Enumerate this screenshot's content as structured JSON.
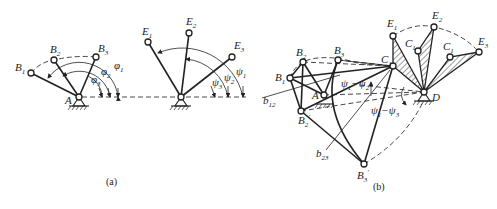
{
  "figure": {
    "panels": [
      {
        "id": "a",
        "caption": "(a)",
        "left_mechanism": {
          "pivot_label": "A",
          "points": [
            {
              "label": "B",
              "sub": "1"
            },
            {
              "label": "B",
              "sub": "2"
            },
            {
              "label": "B",
              "sub": "3"
            }
          ],
          "angles": [
            {
              "symbol": "φ",
              "sub": "1"
            },
            {
              "symbol": "φ",
              "sub": "2"
            },
            {
              "symbol": "φ",
              "sub": "3"
            }
          ]
        },
        "right_mechanism": {
          "points": [
            {
              "label": "E",
              "sub": "1"
            },
            {
              "label": "E",
              "sub": "2"
            },
            {
              "label": "E",
              "sub": "3"
            }
          ],
          "angles": [
            {
              "symbol": "ψ",
              "sub": "1"
            },
            {
              "symbol": "ψ",
              "sub": "2"
            },
            {
              "symbol": "ψ",
              "sub": "3"
            }
          ]
        }
      },
      {
        "id": "b",
        "caption": "(b)",
        "labels": {
          "A": "A",
          "D": "D",
          "B1": {
            "label": "B",
            "sub": "1"
          },
          "B2": {
            "label": "B",
            "sub": "2"
          },
          "B3": {
            "label": "B",
            "sub": "3"
          },
          "B2p": {
            "label": "B",
            "sub": "2",
            "prime": "′"
          },
          "B3p": {
            "label": "B",
            "sub": "3",
            "prime": "′"
          },
          "C1": {
            "label": "C",
            "sub": "1"
          },
          "C1b": {
            "label": "C",
            "sub": "1"
          },
          "C1c": {
            "label": "C",
            "sub": "1"
          },
          "E1": {
            "label": "E",
            "sub": "1"
          },
          "E2": {
            "label": "E",
            "sub": "2"
          },
          "E3": {
            "label": "E",
            "sub": "3"
          },
          "b12": {
            "label": "b",
            "sub": "12"
          },
          "b23": {
            "label": "b",
            "sub": "23"
          },
          "psi12": {
            "a": "ψ",
            "a_sub": "1",
            "op": "−",
            "b": "ψ",
            "b_sub": "2"
          },
          "psi13": {
            "a": "ψ",
            "a_sub": "1",
            "op": "−",
            "b": "ψ",
            "b_sub": "3"
          }
        }
      }
    ]
  }
}
